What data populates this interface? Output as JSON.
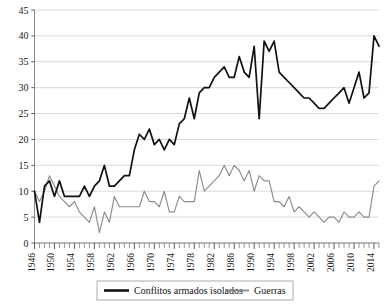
{
  "chart_data": {
    "type": "line",
    "title": "",
    "subtitle": "",
    "xlabel": "",
    "ylabel": "",
    "ylim": [
      0,
      45
    ],
    "xlim": [
      1946,
      2015
    ],
    "ytick_values": [
      0,
      5,
      10,
      15,
      20,
      25,
      30,
      35,
      40,
      45
    ],
    "ytick_labels": [
      "0",
      "5",
      "10",
      "15",
      "20",
      "25",
      "30",
      "35",
      "40",
      "45"
    ],
    "xtick_labels": [
      "1946",
      "1950",
      "1954",
      "1958",
      "1962",
      "1966",
      "1970",
      "1974",
      "1978",
      "1982",
      "1986",
      "1990",
      "1994",
      "1998",
      "2002",
      "2006",
      "2010",
      "2014"
    ],
    "xtick_values": [
      1946,
      1950,
      1954,
      1958,
      1962,
      1966,
      1970,
      1974,
      1978,
      1982,
      1986,
      1990,
      1994,
      1998,
      2002,
      2006,
      2010,
      2014
    ],
    "minor_ticks": true,
    "grid": true,
    "grid_axis": "y",
    "legend_position": "bottom",
    "x": [
      1946,
      1947,
      1948,
      1949,
      1950,
      1951,
      1952,
      1953,
      1954,
      1955,
      1956,
      1957,
      1958,
      1959,
      1960,
      1961,
      1962,
      1963,
      1964,
      1965,
      1966,
      1967,
      1968,
      1969,
      1970,
      1971,
      1972,
      1973,
      1974,
      1975,
      1976,
      1977,
      1978,
      1979,
      1980,
      1981,
      1982,
      1983,
      1984,
      1985,
      1986,
      1987,
      1988,
      1989,
      1990,
      1991,
      1992,
      1993,
      1994,
      1995,
      1996,
      1997,
      1998,
      1999,
      2000,
      2001,
      2002,
      2003,
      2004,
      2005,
      2006,
      2007,
      2008,
      2009,
      2010,
      2011,
      2012,
      2013,
      2014,
      2015
    ],
    "series": [
      {
        "name": "Conflitos armados isolados",
        "color": "#111111",
        "values": [
          10,
          4,
          11,
          12,
          9,
          12,
          9,
          9,
          9,
          9,
          11,
          9,
          11,
          12,
          15,
          11,
          11,
          12,
          13,
          13,
          18,
          21,
          20,
          22,
          19,
          20,
          18,
          20,
          19,
          23,
          24,
          28,
          24,
          29,
          30,
          30,
          32,
          33,
          34,
          32,
          32,
          36,
          33,
          32,
          38,
          24,
          39,
          37,
          39,
          33,
          32,
          31,
          30,
          29,
          28,
          28,
          27,
          26,
          26,
          27,
          28,
          29,
          30,
          27,
          30,
          33,
          28,
          29,
          40,
          38
        ]
      },
      {
        "name": "Guerras",
        "color": "#8c8c8c",
        "values": [
          10,
          8,
          10,
          13,
          11,
          9,
          8,
          7,
          8,
          6,
          5,
          4,
          7,
          2,
          6,
          4,
          9,
          7,
          7,
          7,
          7,
          7,
          10,
          8,
          8,
          7,
          10,
          6,
          6,
          9,
          8,
          8,
          8,
          14,
          10,
          11,
          12,
          13,
          15,
          13,
          15,
          14,
          12,
          14,
          10,
          13,
          12,
          12,
          8,
          8,
          7,
          9,
          6,
          7,
          6,
          5,
          6,
          5,
          4,
          5,
          5,
          4,
          6,
          5,
          5,
          6,
          5,
          5,
          11,
          12
        ]
      }
    ]
  },
  "legend": {
    "items": [
      {
        "label": "Conflitos armados isolados",
        "color": "#111111"
      },
      {
        "label": "Guerras",
        "color": "#8c8c8c"
      }
    ]
  }
}
